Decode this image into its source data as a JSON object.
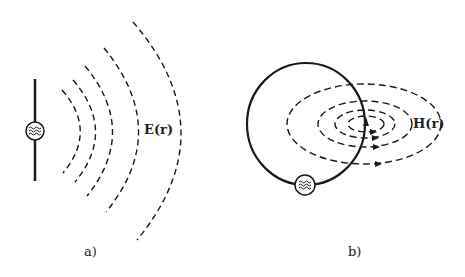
{
  "panels": [
    {
      "id": "a",
      "caption": "a)",
      "field_label": "E(r)",
      "description": "Dipole antenna with AC source radiating electric field wavefronts",
      "source_symbol": "≈"
    },
    {
      "id": "b",
      "caption": "b)",
      "field_label": "H(r)",
      "description": "Loop antenna with AC source and magnetic field lines",
      "source_symbol": "≈"
    }
  ],
  "colors": {
    "line": "#1a1a1a",
    "background": "#ffffff"
  }
}
